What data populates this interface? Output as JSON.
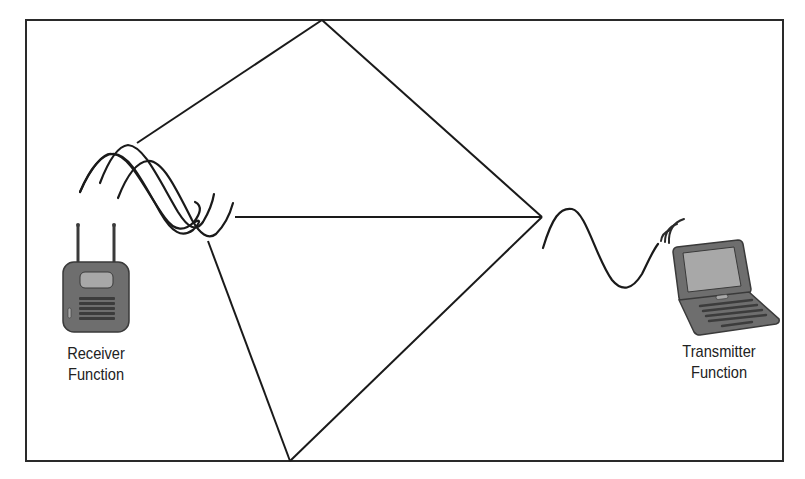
{
  "diagram": {
    "colors": {
      "line": "#1a1a1a",
      "device_body": "#6e6e6e",
      "device_dark": "#444444",
      "device_screen": "#a8a8a8",
      "background": "#ffffff"
    },
    "frame": {
      "x": 26,
      "y": 20,
      "width": 757,
      "height": 441
    },
    "reflection_points": [
      {
        "name": "top",
        "x": 322,
        "y": 20
      },
      {
        "name": "bottom",
        "x": 290,
        "y": 461
      },
      {
        "name": "convergence",
        "x": 542,
        "y": 217
      }
    ],
    "paths": [
      {
        "from": [
          137,
          143
        ],
        "to": [
          322,
          20
        ]
      },
      {
        "from": [
          322,
          20
        ],
        "to": [
          542,
          217
        ]
      },
      {
        "from": [
          235,
          217
        ],
        "to": [
          542,
          217
        ]
      },
      {
        "from": [
          208,
          241
        ],
        "to": [
          290,
          461
        ]
      },
      {
        "from": [
          290,
          461
        ],
        "to": [
          542,
          217
        ]
      }
    ]
  },
  "receiver": {
    "icon": "wireless-access-point-icon",
    "label_line1": "Receiver",
    "label_line2": "Function"
  },
  "transmitter": {
    "icon": "laptop-icon",
    "signal_icon": "wifi-signal-icon",
    "label_line1": "Transmitter",
    "label_line2": "Function"
  }
}
